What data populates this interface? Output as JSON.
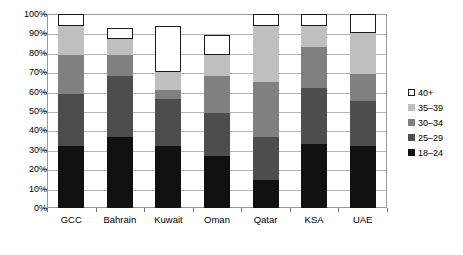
{
  "chart_data": {
    "type": "bar",
    "subtype": "stacked-bar-percent",
    "title": "",
    "xlabel": "",
    "ylabel": "",
    "ylim": [
      0,
      100
    ],
    "grid": true,
    "legend_position": "right",
    "categories": [
      "GCC",
      "Bahrain",
      "Kuwait",
      "Oman",
      "Qatar",
      "KSA",
      "UAE"
    ],
    "y_ticks": [
      "0%",
      "10%",
      "20%",
      "30%",
      "40%",
      "50%",
      "60%",
      "70%",
      "80%",
      "90%",
      "100%"
    ],
    "y_tick_values": [
      0,
      10,
      20,
      30,
      40,
      50,
      60,
      70,
      80,
      90,
      100
    ],
    "series": [
      {
        "name": "18–24",
        "color": "#111111",
        "outlined": false,
        "values": [
          32,
          36.5,
          32,
          27,
          14.5,
          33,
          32
        ]
      },
      {
        "name": "25–29",
        "color": "#4d4d4d",
        "outlined": false,
        "values": [
          27,
          31.5,
          24,
          22,
          22,
          29,
          23
        ]
      },
      {
        "name": "30–34",
        "color": "#808080",
        "outlined": false,
        "values": [
          20,
          11,
          5,
          19,
          28.5,
          21,
          14
        ]
      },
      {
        "name": "35–39",
        "color": "#bfbfbf",
        "outlined": false,
        "values": [
          15,
          8,
          9,
          11,
          29,
          11,
          21
        ]
      },
      {
        "name": "40+",
        "color": "#ffffff",
        "outlined": true,
        "values": [
          6,
          6,
          24,
          10,
          6,
          6,
          10
        ]
      }
    ],
    "legend_order_top_to_bottom": [
      "40+",
      "35–39",
      "30–34",
      "25–29",
      "18–24"
    ]
  }
}
